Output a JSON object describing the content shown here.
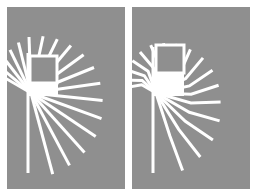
{
  "colors": {
    "background": "#ffffff",
    "panel": "#8f8f8f",
    "line": "#ffffff"
  },
  "panels": [
    {
      "id": "left",
      "x": 7,
      "y": 7,
      "w": 118,
      "h": 182,
      "stem": {
        "x": 21,
        "y1": 46,
        "y2": 166
      },
      "box": {
        "x": 23,
        "y": 49,
        "w": 27,
        "h": 27
      },
      "origin": {
        "x": 24,
        "y": 86
      },
      "style": "straight",
      "rays": [
        {
          "angle": -150,
          "len": 35
        },
        {
          "angle": -140,
          "len": 40
        },
        {
          "angle": -128,
          "len": 44
        },
        {
          "angle": -116,
          "len": 48
        },
        {
          "angle": -104,
          "len": 52
        },
        {
          "angle": -92,
          "len": 56
        },
        {
          "angle": -78,
          "len": 58
        },
        {
          "angle": -64,
          "len": 60
        },
        {
          "angle": -50,
          "len": 62
        },
        {
          "angle": -36,
          "len": 65
        },
        {
          "angle": -22,
          "len": 68
        },
        {
          "angle": -8,
          "len": 70
        },
        {
          "angle": 6,
          "len": 72
        },
        {
          "angle": 20,
          "len": 75
        },
        {
          "angle": 34,
          "len": 78
        },
        {
          "angle": 48,
          "len": 80
        },
        {
          "angle": 62,
          "len": 82
        },
        {
          "angle": 75,
          "len": 84
        }
      ]
    },
    {
      "id": "right",
      "x": 132,
      "y": 7,
      "w": 118,
      "h": 182,
      "stem": {
        "x": 21,
        "y1": 40,
        "y2": 166
      },
      "box": {
        "x": 24,
        "y": 38,
        "w": 28,
        "h": 28
      },
      "origin": {
        "x": 24,
        "y": 86
      },
      "style": "bent",
      "rays": [
        {
          "angle": -150,
          "len": 30,
          "bend": -40
        },
        {
          "angle": -138,
          "len": 34,
          "bend": -40
        },
        {
          "angle": -124,
          "len": 38,
          "bend": -38
        },
        {
          "angle": -110,
          "len": 42,
          "bend": -36
        },
        {
          "angle": -96,
          "len": 46,
          "bend": -34
        },
        {
          "angle": -82,
          "len": 50,
          "bend": -32
        },
        {
          "angle": -68,
          "len": 52,
          "bend": -30
        },
        {
          "angle": -54,
          "len": 55,
          "bend": -28
        },
        {
          "angle": -40,
          "len": 57,
          "bend": -26
        },
        {
          "angle": -26,
          "len": 60,
          "bend": -24
        },
        {
          "angle": -12,
          "len": 62,
          "bend": -22
        },
        {
          "angle": 2,
          "len": 64,
          "bend": -20
        },
        {
          "angle": 16,
          "len": 66,
          "bend": -18
        },
        {
          "angle": 30,
          "len": 70,
          "bend": -14
        },
        {
          "angle": 44,
          "len": 74,
          "bend": -10
        },
        {
          "angle": 58,
          "len": 78,
          "bend": -6
        },
        {
          "angle": 72,
          "len": 82,
          "bend": -2
        }
      ]
    }
  ]
}
